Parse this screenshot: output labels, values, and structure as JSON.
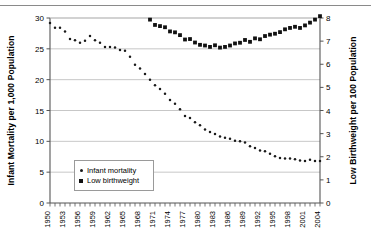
{
  "axes": {
    "left_title": "Infant Mortality per 1,000 Population",
    "right_title": "Low Birthweight per 100 Population",
    "left_ticks": [
      "0",
      "5",
      "10",
      "15",
      "20",
      "25",
      "30"
    ],
    "right_ticks": [
      "0",
      "1",
      "2",
      "3",
      "4",
      "5",
      "6",
      "7",
      "8"
    ]
  },
  "legend": {
    "items": [
      {
        "label": "Infant mortality",
        "marker": "dot-marker",
        "color": "#1a1a1a"
      },
      {
        "label": "Low birthweight",
        "marker": "square-marker",
        "color": "#111111"
      }
    ]
  },
  "chart_data": {
    "type": "scatter",
    "title": "",
    "xlabel": "",
    "ylabel": "Infant Mortality per 1,000 Population",
    "y2label": "Low Birthweight per 100 Population",
    "xlim": [
      1950,
      2004
    ],
    "ylim": [
      0,
      30
    ],
    "y2lim": [
      0,
      8
    ],
    "grid": true,
    "legend_position": "inside-lower-left",
    "xtick_labels": [
      "1950",
      "1953",
      "1956",
      "1959",
      "1962",
      "1965",
      "1968",
      "1971",
      "1974",
      "1977",
      "1980",
      "1983",
      "1986",
      "1989",
      "1992",
      "1995",
      "1998",
      "2001",
      "2004"
    ],
    "xtick_step": 3,
    "x": [
      1950,
      1951,
      1952,
      1953,
      1954,
      1955,
      1956,
      1957,
      1958,
      1959,
      1960,
      1961,
      1962,
      1963,
      1964,
      1965,
      1966,
      1967,
      1968,
      1969,
      1970,
      1971,
      1972,
      1973,
      1974,
      1975,
      1976,
      1977,
      1978,
      1979,
      1980,
      1981,
      1982,
      1983,
      1984,
      1985,
      1986,
      1987,
      1988,
      1989,
      1990,
      1991,
      1992,
      1993,
      1994,
      1995,
      1996,
      1997,
      1998,
      1999,
      2000,
      2001,
      2002,
      2003,
      2004
    ],
    "series": [
      {
        "name": "Infant mortality",
        "axis": "left",
        "units": "deaths per 1,000 live births",
        "values": [
          29.2,
          28.4,
          28.4,
          27.8,
          26.6,
          26.4,
          26.0,
          26.3,
          27.1,
          26.4,
          26.0,
          25.3,
          25.3,
          25.2,
          24.8,
          24.7,
          23.7,
          22.4,
          21.8,
          20.9,
          20.0,
          19.1,
          18.5,
          17.7,
          16.7,
          16.1,
          15.2,
          14.1,
          13.8,
          13.1,
          12.6,
          11.9,
          11.5,
          11.2,
          10.8,
          10.6,
          10.4,
          10.1,
          10.0,
          9.8,
          9.2,
          8.9,
          8.5,
          8.4,
          8.0,
          7.6,
          7.3,
          7.2,
          7.2,
          7.1,
          6.9,
          6.8,
          7.0,
          6.8,
          6.8
        ]
      },
      {
        "name": "Low birthweight",
        "axis": "right",
        "units": "percent of live births",
        "values": [
          null,
          null,
          null,
          null,
          null,
          null,
          null,
          null,
          null,
          null,
          null,
          null,
          null,
          null,
          null,
          null,
          null,
          null,
          null,
          null,
          7.93,
          7.7,
          7.65,
          7.6,
          7.42,
          7.38,
          7.26,
          7.07,
          7.09,
          6.94,
          6.84,
          6.81,
          6.75,
          6.82,
          6.72,
          6.75,
          6.81,
          6.9,
          6.93,
          7.05,
          6.97,
          7.12,
          7.08,
          7.22,
          7.28,
          7.32,
          7.39,
          7.51,
          7.57,
          7.62,
          7.57,
          7.68,
          7.8,
          7.93,
          8.08
        ]
      }
    ]
  }
}
